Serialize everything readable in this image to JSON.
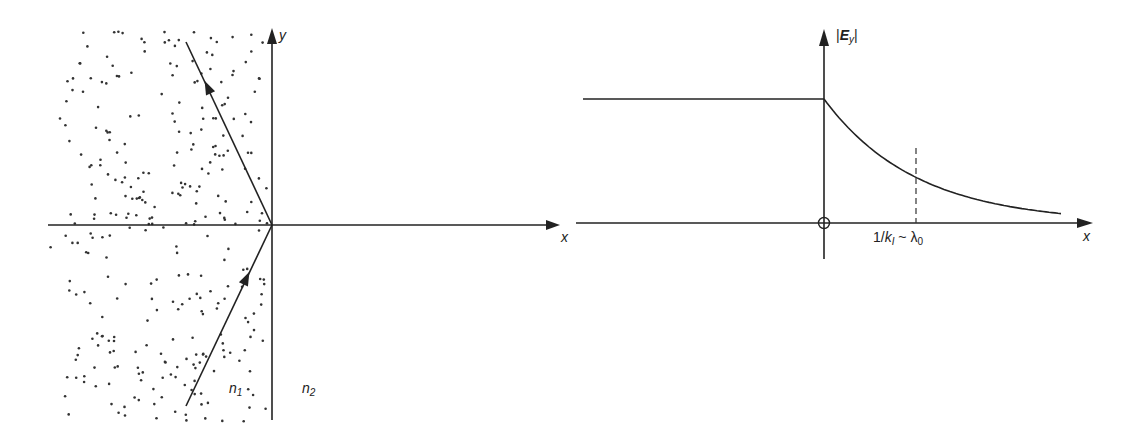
{
  "figure": {
    "left_panel": {
      "title": "Total internal reflection at interface",
      "axis_x_label": "x",
      "axis_y_label": "y",
      "medium_1_label": "n",
      "medium_1_sub": "1",
      "medium_2_label": "n",
      "medium_2_sub": "2",
      "rays": [
        "incident",
        "reflected"
      ]
    },
    "right_panel": {
      "axis_y_label_abs_open": "|",
      "axis_y_label_E": "E",
      "axis_y_label_sub": "y",
      "axis_y_label_abs_close": "|",
      "axis_x_label": "x",
      "origin_marker": "circle-cross",
      "decay_length_label_prefix": "1/",
      "decay_length_k": "k",
      "decay_length_k_sub": "I",
      "decay_length_sim": " ~ ",
      "decay_length_lambda": "λ",
      "decay_length_lambda_sub": "0",
      "profile": {
        "region_x_negative": "constant amplitude",
        "region_x_positive": "exponential decay",
        "decay_marker_at": "1/k_I"
      }
    },
    "colors": {
      "ink": "#222222",
      "background": "#ffffff",
      "dots": "#333333"
    }
  }
}
